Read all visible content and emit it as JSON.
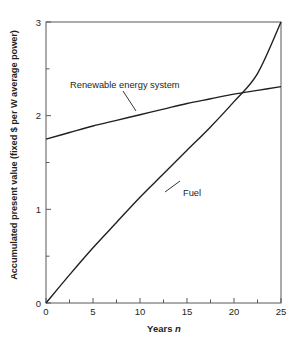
{
  "chart_data": {
    "type": "line",
    "title": "",
    "xlabel": "Years n",
    "xlabel_plain": "Years",
    "xlabel_italic": "n",
    "ylabel": "Accumulated present value (fixed $ per W average power)",
    "xlim": [
      0,
      25
    ],
    "ylim": [
      0,
      3
    ],
    "grid": false,
    "legend": "inline-annotations",
    "x_ticks": [
      "0",
      "5",
      "10",
      "15",
      "20",
      "25"
    ],
    "x_tick_values": [
      0,
      5,
      10,
      15,
      20,
      25
    ],
    "x_minor_tick_values": [
      2.5,
      7.5,
      12.5,
      17.5,
      22.5
    ],
    "y_ticks": [
      "0",
      "1",
      "2",
      "3"
    ],
    "y_tick_values": [
      0,
      1,
      2,
      3
    ],
    "y_minor_tick_values": [
      0.5,
      1.5,
      2.5
    ],
    "x": [
      0,
      2.5,
      5,
      7.5,
      10,
      12.5,
      15,
      17.5,
      20,
      22.5,
      25
    ],
    "series": [
      {
        "name": "Renewable energy system",
        "label": "Renewable energy system",
        "values": [
          1.75,
          1.82,
          1.89,
          1.95,
          2.01,
          2.07,
          2.13,
          2.18,
          2.23,
          2.27,
          2.31
        ]
      },
      {
        "name": "Fuel",
        "label": "Fuel",
        "values": [
          0.0,
          0.3,
          0.59,
          0.86,
          1.13,
          1.38,
          1.63,
          1.88,
          2.15,
          2.45,
          3.0
        ]
      }
    ],
    "annotations": [
      {
        "text": "Renewable energy system",
        "target_series": "Renewable energy system",
        "target_x": 8.0,
        "target_y": 1.99
      },
      {
        "text": "Fuel",
        "target_series": "Fuel",
        "target_x": 10.5,
        "target_y": 1.18
      }
    ],
    "crossing_point": {
      "x": 16.8,
      "y": 2.2
    },
    "colors": {
      "line": "#231f20",
      "frame": "#58595b",
      "text": "#231f20",
      "background": "#ffffff"
    }
  }
}
